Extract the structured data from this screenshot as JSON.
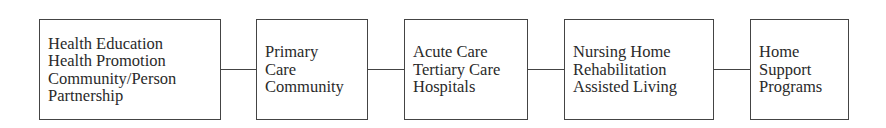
{
  "diagram": {
    "type": "linear continuum flow",
    "boxes": [
      {
        "id": "box-1",
        "lines": [
          "Health Education",
          "Health Promotion",
          "Community/Person",
          "Partnership"
        ]
      },
      {
        "id": "box-2",
        "lines": [
          "Primary",
          "Care",
          "Community"
        ]
      },
      {
        "id": "box-3",
        "lines": [
          "Acute Care",
          "Tertiary Care",
          "Hospitals"
        ]
      },
      {
        "id": "box-4",
        "lines": [
          "Nursing Home",
          "Rehabilitation",
          "Assisted Living"
        ]
      },
      {
        "id": "box-5",
        "lines": [
          "Home",
          "Support",
          "Programs"
        ]
      }
    ],
    "connectors": [
      {
        "from": "box-1",
        "to": "box-2"
      },
      {
        "from": "box-2",
        "to": "box-3"
      },
      {
        "from": "box-3",
        "to": "box-4"
      },
      {
        "from": "box-4",
        "to": "box-5"
      }
    ],
    "colors": {
      "border": "#444444",
      "text": "#2a2a2a",
      "background": "#ffffff"
    }
  }
}
